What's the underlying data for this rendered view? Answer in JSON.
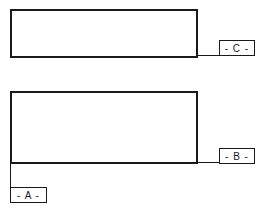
{
  "diagram": {
    "boxes": [
      {
        "id": "top-box",
        "label": ""
      },
      {
        "id": "bottom-box",
        "label": ""
      }
    ],
    "labels": {
      "c": "- C -",
      "b": "- B -",
      "a": "- A -"
    },
    "colors": {
      "stroke": "#1a1a1a",
      "background": "#ffffff"
    }
  }
}
